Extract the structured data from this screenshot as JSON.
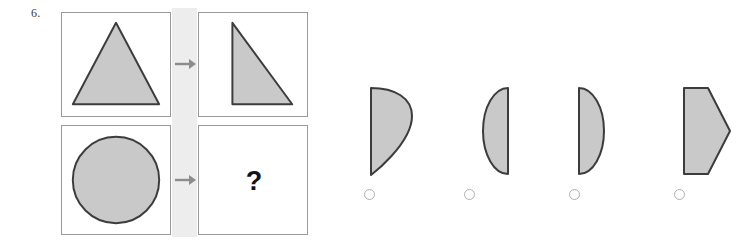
{
  "question": {
    "number": "6.",
    "unknown_marker": "?"
  },
  "colors": {
    "shape_fill": "#c9c9c9",
    "shape_stroke": "#3c3c3c",
    "panel_border": "#9a9a9a",
    "connector_strip": "#ededed",
    "arrow": "#8c8c8c",
    "radio_border": "#b0b0b0",
    "text": "#3a3a3a",
    "qmark": "#131313",
    "page_background": "#ffffff"
  },
  "analogy": {
    "panels": [
      {
        "position": "top-left",
        "shape_name": "filled-triangle",
        "description": "Large shaded isosceles triangle pointing up"
      },
      {
        "position": "top-right",
        "shape_name": "right-half-triangle",
        "description": "Shaded right triangle, right half of the isosceles triangle"
      },
      {
        "position": "bottom-left",
        "shape_name": "filled-circle",
        "description": "Large shaded circle"
      },
      {
        "position": "bottom-right",
        "shape_name": "unknown-answer",
        "description": "Empty panel containing a question mark"
      }
    ],
    "arrows": [
      {
        "name": "transform-arrow-top",
        "direction": "right"
      },
      {
        "name": "transform-arrow-bottom",
        "direction": "right"
      }
    ]
  },
  "options": [
    {
      "index": 1,
      "shape_name": "teardrop-leaf",
      "description": "Flat vertical left edge with rounded top-right bulge tapering to a point at the bottom",
      "selected": false
    },
    {
      "index": 2,
      "shape_name": "left-facing-semicircle",
      "description": "Half circle with flat edge on the right, curve bulging left",
      "selected": false
    },
    {
      "index": 3,
      "shape_name": "right-facing-semicircle",
      "description": "Half circle with flat edge on the left, curve bulging right",
      "selected": false
    },
    {
      "index": 4,
      "shape_name": "right-pointing-pentagon",
      "description": "Flat vertical left edge with a pointed apex on the right",
      "selected": false
    }
  ]
}
